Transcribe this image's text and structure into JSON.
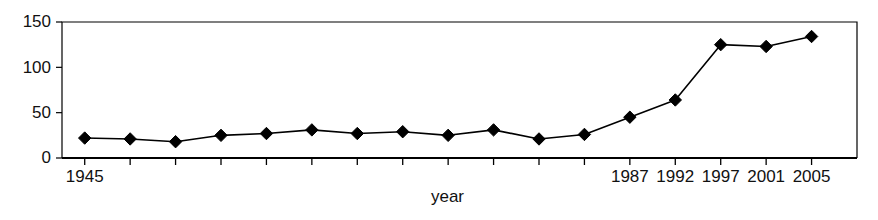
{
  "chart_data": {
    "type": "line",
    "title": "",
    "xlabel": "year",
    "ylabel": "",
    "x": [
      1945,
      1950,
      1955,
      1960,
      1965,
      1970,
      1975,
      1977,
      1979,
      1981,
      1983,
      1985,
      1987,
      1992,
      1997,
      2001,
      2005
    ],
    "values": [
      22,
      21,
      18,
      25,
      27,
      31,
      27,
      29,
      25,
      31,
      21,
      26,
      45,
      64,
      125,
      123,
      134
    ],
    "x_positions": [
      1,
      2,
      3,
      4,
      5,
      6,
      7,
      8,
      9,
      10,
      11,
      12,
      13,
      14,
      15,
      16,
      17
    ],
    "xtick_labels": [
      "1945",
      "",
      "",
      "",
      "",
      "",
      "",
      "",
      "",
      "",
      "",
      "",
      "1987",
      "1992",
      "1997",
      "2001",
      "2005"
    ],
    "ytick_labels": [
      "0",
      "50",
      "100",
      "150"
    ],
    "ytick_values": [
      0,
      50,
      100,
      150
    ],
    "ylim": [
      0,
      150
    ],
    "grid": false,
    "legend": "none",
    "marker": "diamond",
    "line_color": "#000000",
    "marker_color": "#000000",
    "axis_color": "#000000",
    "background": "#ffffff"
  },
  "labels": {
    "x_axis_title": "year"
  }
}
